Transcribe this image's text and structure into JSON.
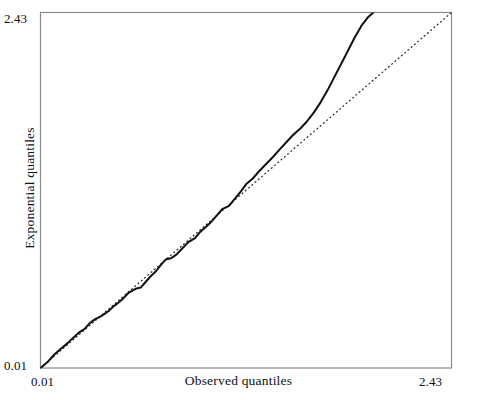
{
  "chart_data": {
    "type": "line",
    "title": "",
    "xlabel": "Observed quantiles",
    "ylabel": "Exponential quantiles",
    "xlim": [
      0.01,
      2.43
    ],
    "ylim": [
      0.01,
      2.43
    ],
    "xticks": [
      "0.01",
      "2.43"
    ],
    "yticks": [
      "0.01",
      "2.43"
    ],
    "grid": false,
    "legend": null,
    "series": [
      {
        "name": "reference-line",
        "style": "dotted",
        "color": "#2b2b2b",
        "x": [
          0.01,
          2.43
        ],
        "y": [
          0.01,
          2.43
        ]
      },
      {
        "name": "qq-curve",
        "style": "solid",
        "color": "#111111",
        "x": [
          0.01,
          0.05,
          0.09,
          0.13,
          0.17,
          0.2,
          0.24,
          0.27,
          0.3,
          0.33,
          0.37,
          0.41,
          0.44,
          0.47,
          0.5,
          0.53,
          0.57,
          0.6,
          0.63,
          0.66,
          0.69,
          0.72,
          0.75,
          0.78,
          0.81,
          0.85,
          0.88,
          0.92,
          0.95,
          0.98,
          1.01,
          1.05,
          1.08,
          1.12,
          1.15,
          1.19,
          1.22,
          1.26,
          1.3,
          1.34,
          1.38,
          1.42,
          1.46,
          1.5,
          1.54,
          1.58,
          1.62,
          1.66,
          1.7,
          1.74,
          1.78,
          1.82,
          1.86,
          1.9,
          1.94,
          1.97
        ],
        "y": [
          0.01,
          0.05,
          0.1,
          0.14,
          0.18,
          0.21,
          0.25,
          0.28,
          0.32,
          0.34,
          0.37,
          0.4,
          0.42,
          0.45,
          0.49,
          0.52,
          0.55,
          0.57,
          0.6,
          0.63,
          0.67,
          0.71,
          0.74,
          0.76,
          0.79,
          0.83,
          0.87,
          0.9,
          0.93,
          0.96,
          1.0,
          1.05,
          1.09,
          1.12,
          1.16,
          1.21,
          1.26,
          1.3,
          1.35,
          1.4,
          1.45,
          1.5,
          1.55,
          1.6,
          1.64,
          1.69,
          1.75,
          1.82,
          1.9,
          1.99,
          2.08,
          2.17,
          2.26,
          2.34,
          2.4,
          2.43
        ]
      }
    ]
  },
  "axis_labels": {
    "y_max": "2.43",
    "y_min": "0.01",
    "x_min": "0.01",
    "x_max": "2.43",
    "x_title": "Observed quantiles",
    "y_title": "Exponential quantiles"
  },
  "style": {
    "frame_color": "#8a8a8a",
    "curve_color": "#111111",
    "reference_color": "#2b2b2b",
    "background": "#ffffff"
  }
}
